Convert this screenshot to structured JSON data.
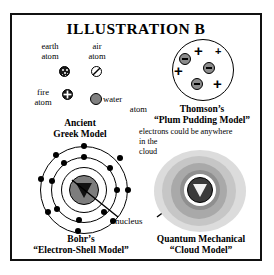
{
  "illustration": {
    "title": "ILLUSTRATION B",
    "border_color": "#111111",
    "background": "#ffffff"
  },
  "greek_model": {
    "caption_line1": "Ancient",
    "caption_line2": "Greek Model",
    "atoms": [
      {
        "name": "earth-atom",
        "label_line1": "earth",
        "label_line2": "atom",
        "glyph": "speckled-dark-circle",
        "color": "#1a1a1a"
      },
      {
        "name": "air-atom",
        "label_line1": "air",
        "label_line2": "atom",
        "glyph": "slashed-circle",
        "color": "#ffffff"
      },
      {
        "name": "fire-atom",
        "label_line1": "fire",
        "label_line2": "atom",
        "glyph": "cross-dark-circle",
        "color": "#1a1a1a"
      },
      {
        "name": "water-atom",
        "label_line1": "water",
        "label_line2": "atom",
        "glyph": "gray-filled-circle",
        "color": "#808080"
      }
    ]
  },
  "thomson_model": {
    "caption_line1": "Thomson’s",
    "caption_line2": "“Plum Pudding Model”",
    "electron_count": 3,
    "proton_count": 4,
    "plus_symbol": "+",
    "electron_color": "#8c8c8c",
    "sphere_color": "#ffffff"
  },
  "bohr_model": {
    "caption_line1": "Bohr’s",
    "caption_line2": "“Electron-Shell Model”",
    "shell_count": 3,
    "electrons_per_shell": [
      4,
      6,
      6
    ],
    "nucleus_label": "nucleus",
    "nucleus_color": "#7d7d7d"
  },
  "quantum_model": {
    "caption_line1": "Quantum Mechanical",
    "caption_line2": "“Cloud Model”",
    "note_line1": "electrons could be anywhere",
    "note_line2": "in the",
    "note_line3": "cloud",
    "cloud_colors": [
      "#d9d9d9",
      "#c4c4c4",
      "#a8a8a8",
      "#8f8f8f"
    ],
    "nucleus_color": "#6f6f6f"
  }
}
